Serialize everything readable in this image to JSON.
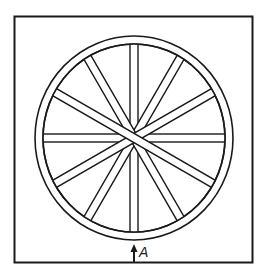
{
  "figure": {
    "frame": {
      "x": 14,
      "y": 16,
      "width": 238,
      "height": 246
    },
    "wheel": {
      "center": [
        134,
        138
      ],
      "outer_radius_x": 99,
      "outer_radius_y": 102,
      "rim_width": 8,
      "spoke_width": 8,
      "spoke_angles_deg": [
        0,
        30,
        60,
        90,
        120,
        150
      ],
      "top_spoke_angle_deg": 150
    },
    "arrow": {
      "x": 134,
      "y_start": 262,
      "y_end": 245
    },
    "label": {
      "text": "A"
    },
    "colors": {
      "stroke": "#1a1a1a",
      "fill": "#ffffff"
    }
  }
}
